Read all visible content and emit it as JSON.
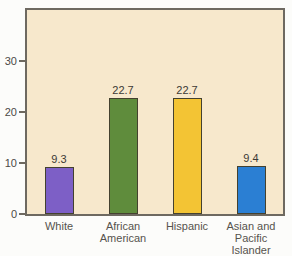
{
  "chart_data": {
    "type": "bar",
    "title": "",
    "xlabel": "",
    "ylabel": "",
    "categories": [
      "White",
      "African American",
      "Hispanic",
      "Asian and Pacific Islander"
    ],
    "category_display": [
      "White",
      "African\nAmerican",
      "Hispanic",
      "Asian and\nPacific Islander"
    ],
    "values": [
      9.3,
      22.7,
      22.7,
      9.4
    ],
    "value_labels": [
      "9.3",
      "22.7",
      "22.7",
      "9.4"
    ],
    "bar_colors": [
      "#7d5fc6",
      "#5f8c3c",
      "#f3c434",
      "#2b7fd3"
    ],
    "ylim": [
      0,
      40
    ],
    "yticks": [
      0,
      10,
      20,
      30
    ],
    "ytick_labels": [
      "0",
      "10",
      "20",
      "30"
    ],
    "grid": false,
    "legend_position": "none",
    "plot_background": "#f7e8cc",
    "border_color": "#6e6960"
  }
}
